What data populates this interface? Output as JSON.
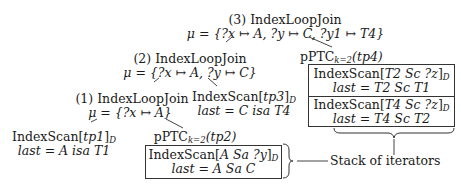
{
  "nodes": {
    "join3": {
      "label": "(3) IndexLoopJoin",
      "mu": "μ = {?x ↦ A, ?y ↦ C, ?y1 ↦ T4}"
    },
    "join2": {
      "label": "(2) IndexLoopJoin",
      "mu": "μ = {?x ↦ A, ?y ↦ C}"
    },
    "join1": {
      "label": "(1) IndexLoopJoin",
      "mu": "μ = {?x ↦ A}"
    },
    "scan_tp1": {
      "scan_prefix": "IndexScan[",
      "scan_arg": "tp1",
      "scan_suffix": "]",
      "scan_sub": "D",
      "last": "last = A isa T1"
    },
    "scan_tp3": {
      "scan_prefix": "IndexScan[",
      "scan_arg": "tp3",
      "scan_suffix": "]",
      "scan_sub": "D",
      "last": "last = C isa T4"
    },
    "pptc_tp2": {
      "title_prefix": "pPTC",
      "title_sub": "k=2",
      "title_arg": "(tp2)",
      "iterators": [
        {
          "scan_prefix": "IndexScan[",
          "scan_arg": "A Sa ?y",
          "scan_suffix": "]",
          "scan_sub": "D",
          "last": "last = A Sa C"
        }
      ]
    },
    "pptc_tp4": {
      "title_prefix": "pPTC",
      "title_sub": "k=2",
      "title_arg": "(tp4)",
      "iterators": [
        {
          "scan_prefix": "IndexScan[",
          "scan_arg": "T2 Sc ?z",
          "scan_suffix": "]",
          "scan_sub": "D",
          "last": "last = T2 Sc T1"
        },
        {
          "scan_prefix": "IndexScan[",
          "scan_arg": "T4 Sc ?z",
          "scan_suffix": "]",
          "scan_sub": "D",
          "last": "last = T4 Sc T2"
        }
      ]
    }
  },
  "annotation": {
    "label": "Stack of iterators"
  },
  "colors": {
    "line": "#333333",
    "text": "#1a1a1a"
  }
}
